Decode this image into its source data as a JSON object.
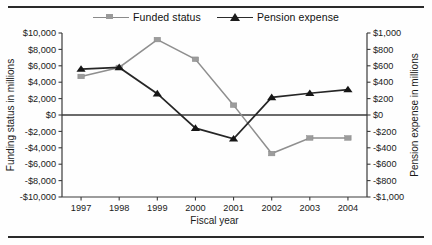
{
  "chart_data": {
    "type": "line",
    "title": "",
    "xlabel": "Fiscal year",
    "categories": [
      "1997",
      "1998",
      "1999",
      "2000",
      "2001",
      "2002",
      "2003",
      "2004"
    ],
    "grid": false,
    "legend_position": "top-center",
    "series": [
      {
        "name": "Funded status",
        "axis": "left",
        "marker": "square",
        "color": "#8f8f8f",
        "unit": "millions of dollars",
        "values": [
          4700,
          5800,
          9200,
          6800,
          1200,
          -4700,
          -2800,
          -2800
        ]
      },
      {
        "name": "Pension expense",
        "axis": "right",
        "marker": "triangle",
        "color": "#262626",
        "unit": "millions of dollars",
        "values": [
          560,
          580,
          260,
          -160,
          -290,
          215,
          265,
          310
        ]
      }
    ],
    "axes": {
      "left": {
        "label": "Funding status in millions",
        "ylim": [
          -10000,
          10000
        ],
        "ticks": [
          10000,
          8000,
          6000,
          4000,
          2000,
          0,
          -2000,
          -4000,
          -6000,
          -8000,
          -10000
        ],
        "ticklabels": [
          "$10,000",
          "$8,000",
          "$6,000",
          "$4,000",
          "$2,000",
          "$0",
          "-$2,000",
          "-$4,000",
          "-$6,000",
          "-$8,000",
          "-$10,000"
        ]
      },
      "right": {
        "label": "Pension expense in millions",
        "ylim": [
          -1000,
          1000
        ],
        "ticks": [
          1000,
          800,
          600,
          400,
          200,
          0,
          -200,
          -400,
          -600,
          -800,
          -1000
        ],
        "ticklabels": [
          "$1,000",
          "$800",
          "$600",
          "$400",
          "$200",
          "$0",
          "-$200",
          "-$400",
          "-$600",
          "-$800",
          "-$1,000"
        ]
      }
    }
  },
  "legend": {
    "entries": [
      {
        "label": "Funded status",
        "icon": "line-square-marker-icon"
      },
      {
        "label": "Pension expense",
        "icon": "line-triangle-marker-icon"
      }
    ]
  }
}
